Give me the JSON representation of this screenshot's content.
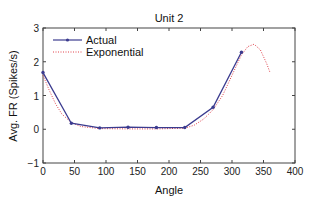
{
  "chart_data": {
    "type": "line",
    "title": "Unit 2",
    "xlabel": "Angle",
    "ylabel": "Avg. FR (Spikes/s)",
    "xlim": [
      0,
      400
    ],
    "ylim": [
      -1,
      3
    ],
    "xticks": [
      0,
      50,
      100,
      150,
      200,
      250,
      300,
      350,
      400
    ],
    "yticks": [
      -1,
      0,
      1,
      2,
      3
    ],
    "grid": false,
    "legend_position": "upper left",
    "series": [
      {
        "name": "Actual",
        "style": "solid-with-markers",
        "color": "#3b3b8f",
        "x": [
          0,
          45,
          90,
          135,
          180,
          225,
          270,
          315
        ],
        "y": [
          1.68,
          0.18,
          0.04,
          0.06,
          0.05,
          0.05,
          0.65,
          2.28
        ]
      },
      {
        "name": "Exponential",
        "style": "dotted",
        "color": "#e0404a",
        "x": [
          0,
          10,
          20,
          30,
          45,
          60,
          90,
          135,
          180,
          225,
          240,
          255,
          270,
          285,
          300,
          315,
          325,
          335,
          345,
          355,
          360
        ],
        "y": [
          1.6,
          1.15,
          0.75,
          0.45,
          0.2,
          0.08,
          0.02,
          0.01,
          0.01,
          0.03,
          0.12,
          0.3,
          0.58,
          1.0,
          1.6,
          2.2,
          2.45,
          2.52,
          2.35,
          1.95,
          1.7
        ]
      }
    ]
  },
  "labels": {
    "title": "Unit 2",
    "xlabel": "Angle",
    "ylabel": "Avg. FR (Spikes/s)",
    "legend_actual": "Actual",
    "legend_exponential": "Exponential"
  }
}
